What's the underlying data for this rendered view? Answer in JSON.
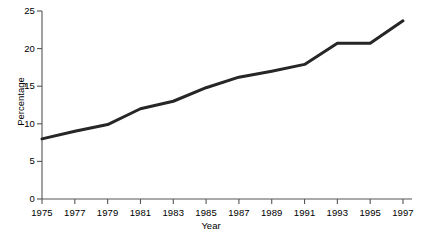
{
  "chart_data": {
    "type": "line",
    "title": "",
    "xlabel": "Year",
    "ylabel": "Percentage",
    "x": [
      1975,
      1977,
      1979,
      1981,
      1983,
      1985,
      1987,
      1989,
      1991,
      1993,
      1995,
      1997
    ],
    "values": [
      8.0,
      9.0,
      9.9,
      12.0,
      13.0,
      14.8,
      16.2,
      17.0,
      17.9,
      20.7,
      20.7,
      23.7
    ],
    "series": [
      {
        "name": "Percentage",
        "values": [
          8.0,
          9.0,
          9.9,
          12.0,
          13.0,
          14.8,
          16.2,
          17.0,
          17.9,
          20.7,
          20.7,
          23.7
        ]
      }
    ],
    "xlim": [
      1975,
      1997
    ],
    "ylim": [
      0,
      25
    ],
    "yticks": [
      0,
      5,
      10,
      15,
      20,
      25
    ],
    "ytick_labels": [
      "0",
      "5",
      "10",
      "15",
      "20",
      "25"
    ],
    "xticks": [
      1975,
      1977,
      1979,
      1981,
      1983,
      1985,
      1987,
      1989,
      1991,
      1993,
      1995,
      1997
    ],
    "xtick_labels": [
      "1975",
      "1977",
      "1979",
      "1981",
      "1983",
      "1985",
      "1987",
      "1989",
      "1991",
      "1993",
      "1995",
      "1997"
    ],
    "grid": false,
    "legend": false,
    "legend_position": "none",
    "line_color": "#262626",
    "line_width": 3,
    "axis_color": "#555555",
    "background_color": "#ffffff"
  },
  "axis": {
    "x_title": "Year",
    "y_title": "Percentage"
  }
}
